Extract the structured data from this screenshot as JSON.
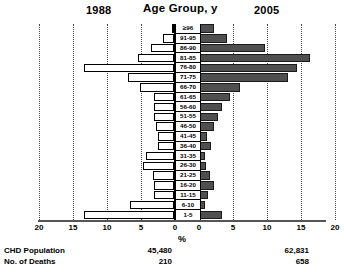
{
  "header": {
    "left_label": "1988",
    "center_label": "Age Group, y",
    "right_label": "2005"
  },
  "axis": {
    "unit_label": "%",
    "left_ticks": [
      "20",
      "15",
      "10",
      "5",
      "0"
    ],
    "right_ticks": [
      "0",
      "5",
      "10",
      "15",
      "20"
    ],
    "max": 20,
    "gridlines_at": [
      5,
      10,
      15,
      20
    ]
  },
  "footer": {
    "rows": [
      {
        "label": "CHD Population",
        "left_value": "45,480",
        "right_value": "62,831"
      },
      {
        "label": "No. of Deaths",
        "left_value": "210",
        "right_value": "658"
      }
    ]
  },
  "colors": {
    "bar_1988": "#ffffff",
    "bar_2005": "#4f4f4f",
    "outline": "#000000",
    "grid": "#4a4a4a"
  },
  "chart_data": {
    "type": "bar",
    "title": "Age Group, y",
    "subtype": "population-pyramid",
    "xlabel": "%",
    "ylabel": "Age Group, y",
    "xlim": [
      0,
      20
    ],
    "grid": true,
    "legend_position": "top",
    "categories": [
      "≥96",
      "91-95",
      "86-90",
      "81-85",
      "76-80",
      "71-75",
      "66-70",
      "61-65",
      "56-60",
      "51-55",
      "46-50",
      "41-45",
      "36-40",
      "31-35",
      "26-30",
      "21-25",
      "16-20",
      "11-15",
      "6-10",
      "1-5"
    ],
    "series": [
      {
        "name": "1988",
        "direction": "left",
        "values": [
          0.3,
          1.6,
          3.4,
          5.3,
          13.2,
          6.7,
          5.0,
          3.0,
          3.0,
          3.0,
          2.6,
          2.3,
          2.3,
          4.1,
          4.6,
          3.1,
          3.0,
          3.0,
          6.5,
          13.3
        ]
      },
      {
        "name": "2005",
        "direction": "right",
        "values": [
          2.1,
          4.0,
          9.6,
          16.2,
          14.2,
          13.0,
          5.9,
          4.4,
          3.2,
          2.6,
          2.1,
          1.1,
          1.6,
          0.8,
          0.9,
          1.4,
          2.0,
          1.2,
          0.7,
          3.3
        ]
      }
    ]
  }
}
